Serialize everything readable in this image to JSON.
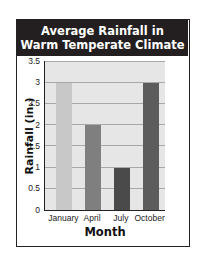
{
  "chart_data": {
    "type": "bar",
    "title": "Average Rainfall in Warm Temperate Climate",
    "title_lines": [
      "Average Rainfall in",
      "Warm Temperate Climate"
    ],
    "xlabel": "Month",
    "ylabel": "Rainfall (in.)",
    "categories": [
      "January",
      "April",
      "July",
      "October"
    ],
    "values": [
      3,
      2,
      1,
      3
    ],
    "bar_colors": [
      "#c8c8c8",
      "#7f7f7f",
      "#4a4a4a",
      "#5c5c5c"
    ],
    "ylim": [
      0,
      3.5
    ],
    "yticks": [
      "0",
      "0.5",
      "1",
      "1.5",
      "2",
      "2.5",
      "3",
      "3.5"
    ],
    "grid": true,
    "legend": null
  }
}
